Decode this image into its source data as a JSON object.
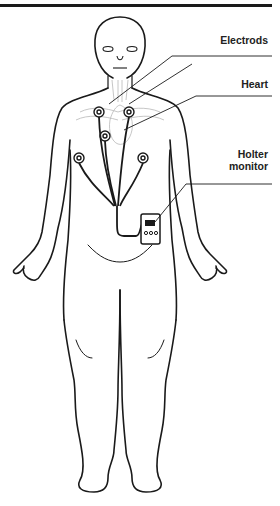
{
  "diagram": {
    "labels": {
      "electrods": "Electrods",
      "heart": "Heart",
      "holter_line1": "Holter",
      "holter_line2": "monitor"
    },
    "colors": {
      "line": "#1a1a1a",
      "faint": "#b8b8b8",
      "background": "#ffffff"
    },
    "electrode_count": 6
  }
}
